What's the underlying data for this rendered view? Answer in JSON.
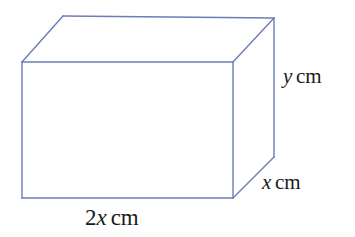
{
  "figure": {
    "kind": "cuboid-diagram",
    "background_color": "#ffffff",
    "edge_color": "#6f7cb5",
    "edge_width_px": 1.4,
    "text_color": "#1a1a1a"
  },
  "geometry": {
    "front_face": {
      "top_left": [
        22,
        62
      ],
      "top_right": [
        233,
        62
      ],
      "bottom_right": [
        233,
        198
      ],
      "bottom_left": [
        22,
        198
      ]
    },
    "back_face_visible": {
      "top_left": [
        63,
        16
      ],
      "top_right": [
        274,
        18
      ],
      "bottom_right": [
        274,
        157
      ]
    },
    "hidden_edges_drawn": false,
    "visible_faces": [
      "front",
      "top",
      "right"
    ]
  },
  "labels": {
    "height": {
      "name": "height-label",
      "coefficient": "",
      "variable": "y",
      "unit": "cm",
      "full_text": "y cm",
      "edge": "vertical right-back edge"
    },
    "depth": {
      "name": "depth-label",
      "coefficient": "",
      "variable": "x",
      "unit": "cm",
      "full_text": "x cm",
      "edge": "oblique depth edge, lower right"
    },
    "width": {
      "name": "width-label",
      "coefficient": "2",
      "variable": "x",
      "unit": "cm",
      "full_text": "2x cm",
      "edge": "bottom front edge"
    }
  }
}
